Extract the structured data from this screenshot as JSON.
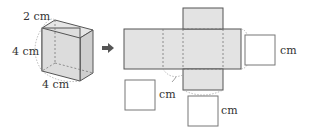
{
  "cuboid": {
    "depth_label": "2 cm",
    "height_label": "4 cm",
    "width_label": "4 cm"
  },
  "arrow": {
    "icon": "right-arrow-icon"
  },
  "net": {
    "answer_boxes": [
      {
        "unit": "cm",
        "position": "right"
      },
      {
        "unit": "cm",
        "position": "bottom-left"
      },
      {
        "unit": "cm",
        "position": "bottom"
      }
    ]
  },
  "colors": {
    "face_fill": "#e3e3e3",
    "edge": "#555555",
    "dashed": "#777777"
  }
}
